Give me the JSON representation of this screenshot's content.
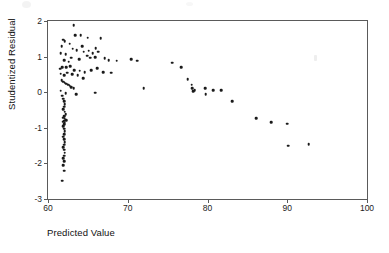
{
  "chart_data": {
    "type": "scatter",
    "title": "",
    "xlabel": "Predicted Value",
    "ylabel": "Studentized Residual",
    "xlim": [
      60,
      100
    ],
    "ylim": [
      -3,
      2
    ],
    "xticks": [
      60,
      70,
      80,
      90,
      100
    ],
    "yticks": [
      2,
      1,
      0,
      -1,
      -2,
      -3
    ],
    "xtick_labels": [
      "60",
      "70",
      "80",
      "90",
      "100"
    ],
    "ytick_labels": [
      "2",
      "1",
      "0",
      "-1",
      "-2",
      "-3"
    ],
    "grid": false,
    "legend": null,
    "marker": "filled-circle",
    "marker_color": "#1a1a1a",
    "points": [
      [
        63.2,
        1.89
      ],
      [
        61.9,
        1.48
      ],
      [
        62.1,
        1.44
      ],
      [
        63.4,
        1.6
      ],
      [
        64.1,
        1.6
      ],
      [
        65.0,
        1.53
      ],
      [
        66.6,
        1.52
      ],
      [
        61.7,
        1.3
      ],
      [
        62.7,
        1.36
      ],
      [
        63.1,
        1.22
      ],
      [
        64.3,
        1.3
      ],
      [
        65.1,
        1.16
      ],
      [
        61.6,
        1.1
      ],
      [
        62.2,
        1.06
      ],
      [
        62.9,
        0.97
      ],
      [
        63.6,
        1.18
      ],
      [
        64.5,
        1.14
      ],
      [
        64.9,
        1.02
      ],
      [
        65.6,
        1.09
      ],
      [
        66.0,
        1.23
      ],
      [
        66.3,
        1.14
      ],
      [
        62.0,
        0.9
      ],
      [
        62.6,
        0.86
      ],
      [
        63.9,
        0.93
      ],
      [
        65.3,
        0.97
      ],
      [
        65.9,
        0.99
      ],
      [
        67.1,
        0.96
      ],
      [
        67.6,
        0.9
      ],
      [
        68.6,
        0.88
      ],
      [
        70.4,
        0.92
      ],
      [
        71.2,
        0.88
      ],
      [
        61.5,
        0.66
      ],
      [
        61.8,
        0.7
      ],
      [
        62.3,
        0.71
      ],
      [
        62.8,
        0.73
      ],
      [
        63.3,
        0.62
      ],
      [
        64.0,
        0.6
      ],
      [
        64.6,
        0.57
      ],
      [
        65.4,
        0.62
      ],
      [
        66.2,
        0.68
      ],
      [
        61.6,
        0.52
      ],
      [
        62.0,
        0.47
      ],
      [
        62.4,
        0.55
      ],
      [
        63.0,
        0.5
      ],
      [
        63.7,
        0.47
      ],
      [
        64.4,
        0.39
      ],
      [
        66.9,
        0.56
      ],
      [
        67.9,
        0.55
      ],
      [
        61.7,
        0.34
      ],
      [
        61.9,
        0.3
      ],
      [
        62.1,
        0.27
      ],
      [
        62.3,
        0.24
      ],
      [
        62.5,
        0.21
      ],
      [
        62.7,
        0.18
      ],
      [
        62.9,
        0.14
      ],
      [
        63.2,
        0.12
      ],
      [
        61.6,
        0.04
      ],
      [
        62.2,
        -0.02
      ],
      [
        63.5,
        -0.05
      ],
      [
        65.9,
        -0.01
      ],
      [
        72.0,
        0.12
      ],
      [
        75.6,
        0.83
      ],
      [
        76.7,
        0.7
      ],
      [
        77.5,
        0.36
      ],
      [
        78.0,
        0.21
      ],
      [
        78.1,
        0.12
      ],
      [
        78.2,
        0.03
      ],
      [
        78.4,
        0.06
      ],
      [
        79.7,
        0.12
      ],
      [
        79.8,
        -0.06
      ],
      [
        80.7,
        0.05
      ],
      [
        81.7,
        0.06
      ],
      [
        83.1,
        -0.25
      ],
      [
        61.8,
        -0.1
      ],
      [
        61.9,
        -0.18
      ],
      [
        62.0,
        -0.26
      ],
      [
        62.1,
        -0.33
      ],
      [
        62.0,
        -0.41
      ],
      [
        61.9,
        -0.48
      ],
      [
        62.1,
        -0.55
      ],
      [
        62.2,
        -0.62
      ],
      [
        62.0,
        -0.68
      ],
      [
        61.9,
        -0.72
      ],
      [
        62.1,
        -0.75
      ],
      [
        62.3,
        -0.78
      ],
      [
        62.0,
        -0.8
      ],
      [
        61.9,
        -0.83
      ],
      [
        62.1,
        -0.86
      ],
      [
        62.0,
        -0.9
      ],
      [
        61.9,
        -0.95
      ],
      [
        62.0,
        -1.02
      ],
      [
        62.1,
        -1.1
      ],
      [
        62.0,
        -1.18
      ],
      [
        61.9,
        -1.25
      ],
      [
        62.0,
        -1.32
      ],
      [
        62.1,
        -1.4
      ],
      [
        62.0,
        -1.47
      ],
      [
        61.9,
        -1.54
      ],
      [
        62.0,
        -1.62
      ],
      [
        62.1,
        -1.7
      ],
      [
        62.0,
        -1.78
      ],
      [
        61.9,
        -1.86
      ],
      [
        62.0,
        -1.94
      ],
      [
        61.9,
        -2.05
      ],
      [
        62.0,
        -2.21
      ],
      [
        61.8,
        -2.49
      ],
      [
        86.1,
        -0.73
      ],
      [
        88.0,
        -0.84
      ],
      [
        90.0,
        -0.88
      ],
      [
        90.1,
        -1.5
      ],
      [
        92.7,
        -1.46
      ]
    ]
  },
  "axes": {
    "y_title": "Studentized Residual",
    "x_title": "Predicted Value"
  }
}
